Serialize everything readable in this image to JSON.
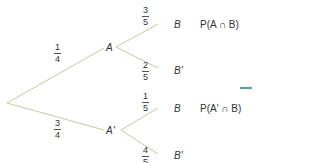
{
  "colors": {
    "branch": "#c5cc9a",
    "text": "#333333",
    "accent": "#4aa89a"
  },
  "tree": {
    "root": {
      "x": 7,
      "y": 103
    },
    "level1": [
      {
        "label": "A",
        "x": 108,
        "y": 47,
        "prob": {
          "num": "1",
          "den": "4"
        }
      },
      {
        "label": "A'",
        "x": 110,
        "y": 130,
        "prob": {
          "num": "3",
          "den": "4"
        }
      }
    ],
    "level2": [
      {
        "label": "B",
        "from": 0,
        "x": 160,
        "y": 20,
        "prob": {
          "num": "3",
          "den": "5"
        },
        "outcome": "P(A ∩ B)"
      },
      {
        "label": "B'",
        "from": 0,
        "x": 160,
        "y": 70,
        "prob": {
          "num": "2",
          "den": "5"
        },
        "outcome": ""
      },
      {
        "label": "B",
        "from": 1,
        "x": 160,
        "y": 105,
        "prob": {
          "num": "1",
          "den": "5"
        },
        "outcome": "P(A' ∩ B)"
      },
      {
        "label": "B'",
        "from": 1,
        "x": 160,
        "y": 157,
        "prob": {
          "num": "4",
          "den": "5"
        },
        "outcome": ""
      }
    ]
  }
}
